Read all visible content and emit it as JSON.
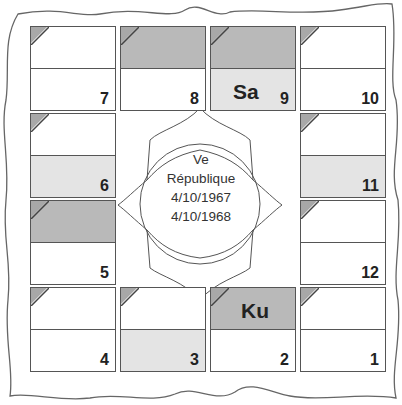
{
  "center": {
    "line1": "Ve",
    "line2": "République",
    "line3": "4/10/1967",
    "line4": "4/10/1968"
  },
  "colors": {
    "border": "#555555",
    "dark_shade": "#b9b9b9",
    "light_shade": "#e4e4e4",
    "corner": "#a8a8a8"
  },
  "houses": {
    "h1": {
      "number": "1",
      "planet": ""
    },
    "h2": {
      "number": "2",
      "planet": "Ku"
    },
    "h3": {
      "number": "3",
      "planet": ""
    },
    "h4": {
      "number": "4",
      "planet": ""
    },
    "h5": {
      "number": "5",
      "planet": ""
    },
    "h6": {
      "number": "6",
      "planet": ""
    },
    "h7": {
      "number": "7",
      "planet": ""
    },
    "h8": {
      "number": "8",
      "planet": ""
    },
    "h9": {
      "number": "9",
      "planet": "Sa"
    },
    "h10": {
      "number": "10",
      "planet": ""
    },
    "h11": {
      "number": "11",
      "planet": ""
    },
    "h12": {
      "number": "12",
      "planet": ""
    }
  }
}
